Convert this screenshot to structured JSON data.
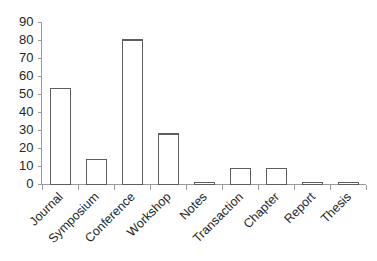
{
  "chart_data": {
    "type": "bar",
    "title": "",
    "subtitle": "",
    "xlabel": "",
    "ylabel": "",
    "categories": [
      "Journal",
      "Symposium",
      "Conference",
      "Workshop",
      "Notes",
      "Transaction",
      "Chapter",
      "Report",
      "Thesis"
    ],
    "values": [
      53,
      14,
      80,
      28,
      1,
      9,
      9,
      1,
      1
    ],
    "ylim": [
      0,
      90
    ],
    "ytick_labels": [
      "0",
      "10",
      "20",
      "30",
      "40",
      "50",
      "60",
      "70",
      "80",
      "90"
    ],
    "ytick_values": [
      0,
      10,
      20,
      30,
      40,
      50,
      60,
      70,
      80,
      90
    ],
    "grid": false,
    "legend": null,
    "legend_position": "none",
    "bar_fill_color": "#ffffff",
    "bar_edge_color": "#5d5d5d",
    "axis_color": "#9a9a9a",
    "text_color": "#262626",
    "background_color": "#ffffff",
    "xtick_label_rotation": -45,
    "annotations": []
  }
}
